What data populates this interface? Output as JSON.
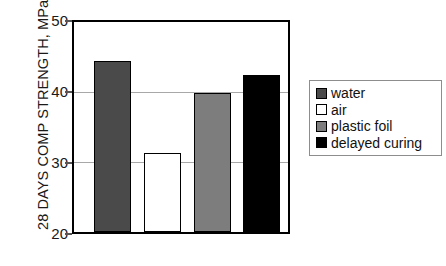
{
  "chart_data": {
    "type": "bar",
    "title": "",
    "subtitle": "",
    "xlabel": "",
    "ylabel": "28 DAYS COMP STRENGTH, MPa",
    "categories": [
      "water",
      "air",
      "plastic foil",
      "delayed curing"
    ],
    "values": [
      44.4,
      31.3,
      39.9,
      42.4
    ],
    "series": [
      {
        "name": "28 days compressive strength",
        "values": [
          44.4,
          31.3,
          39.9,
          42.4
        ]
      }
    ],
    "ylim": [
      20,
      50
    ],
    "yticks": [
      20,
      30,
      40,
      50
    ],
    "ytick_labels": [
      "20",
      "30",
      "40",
      "50"
    ],
    "xtick_labels": [
      "",
      "",
      "",
      ""
    ],
    "grid": "horizontal",
    "legend_position": "right",
    "bar_colors": [
      "#4a4a4a",
      "#ffffff",
      "#7d7d7d",
      "#000000"
    ],
    "bar_edge_color": "#000000",
    "frame_color": "#000000",
    "gridline_color": "#a8a8a8",
    "background": "#ffffff"
  },
  "axis": {
    "y_title": "28 DAYS COMP STRENGTH, MPa",
    "ticks": [
      {
        "label": "50",
        "value": 50
      },
      {
        "label": "40",
        "value": 40
      },
      {
        "label": "30",
        "value": 30
      },
      {
        "label": "20",
        "value": 20
      }
    ]
  },
  "legend": {
    "items": [
      {
        "label": "water",
        "color": "#4a4a4a"
      },
      {
        "label": "air",
        "color": "#ffffff"
      },
      {
        "label": "plastic foil",
        "color": "#7d7d7d"
      },
      {
        "label": "delayed curing",
        "color": "#000000"
      }
    ]
  }
}
